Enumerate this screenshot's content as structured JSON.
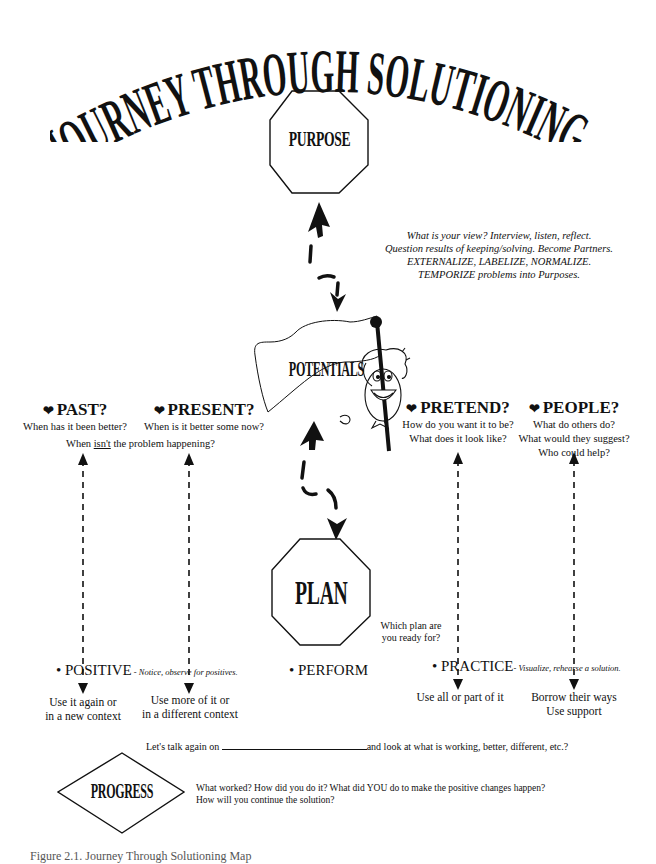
{
  "title": "JOURNEY THROUGH SOLUTIONING",
  "nodes": {
    "purpose": "PURPOSE",
    "potentials": "POTENTIALS",
    "plan": "PLAN",
    "progress": "PROGRESS"
  },
  "purpose_note": {
    "lines": [
      "What is your view? Interview, listen, reflect.",
      "Question results of keeping/solving. Become Partners.",
      "EXTERNALIZE, LABELIZE, NORMALIZE.",
      "TEMPORIZE problems into Purposes."
    ]
  },
  "columns": {
    "past": {
      "heading": "PAST?",
      "icon": "heart-icon",
      "lines": [
        "When has it been better?"
      ]
    },
    "present": {
      "heading": "PRESENT?",
      "icon": "heart-icon",
      "lines": [
        "When is it better some now?"
      ]
    },
    "shared_question": {
      "prefix": "When ",
      "underlined": "isn't",
      "suffix": " the problem happening?"
    },
    "pretend": {
      "heading": "PRETEND?",
      "icon": "heart-icon",
      "lines": [
        "How do you want it to be?",
        "What does it look like?"
      ]
    },
    "people": {
      "heading": "PEOPLE?",
      "icon": "heart-icon",
      "lines": [
        "What do others do?",
        "What would they suggest?",
        "Who could help?"
      ]
    }
  },
  "plan_question": {
    "lines": [
      "Which plan are",
      "you ready for?"
    ]
  },
  "bullets": {
    "positive": {
      "label": "POSITIVE",
      "note": " - Notice, observe for positives."
    },
    "perform": {
      "label": "PERFORM"
    },
    "practice": {
      "label": "PRACTICE",
      "note": "- Visualize, rehearse a solution."
    }
  },
  "outcomes": {
    "past": [
      "Use it again or",
      "in a new context"
    ],
    "present": [
      "Use more of it or",
      "in a different context"
    ],
    "pretend": [
      "Use all or part of it"
    ],
    "people": [
      "Borrow their ways",
      "Use support"
    ]
  },
  "follow_up": {
    "prefix": "Let's talk again  on ",
    "suffix": "and look at what is working, better, different, etc.?"
  },
  "progress_note": {
    "lines": [
      "What worked?  How did you do it?  What did YOU do to make the positive changes happen?",
      "How will you continue the solution?"
    ]
  },
  "caption": "Figure 2.1. Journey Through Solutioning Map"
}
